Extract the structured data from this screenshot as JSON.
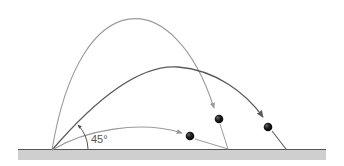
{
  "diagram": {
    "angle_label": "45°",
    "colors": {
      "background": "#ffffff",
      "ground_fill": "#cfcfcf",
      "ground_line": "#555555",
      "light_arc": "#9a9a9a",
      "dark_arc": "#5a5a5a",
      "ball": "#1e1e1e"
    },
    "launch_point": [
      52,
      150
    ],
    "trajectories": [
      {
        "name": "high-angle",
        "apex": [
          140,
          13
        ],
        "ball": [
          219,
          119
        ],
        "landing": [
          228,
          149
        ],
        "shade": "light"
      },
      {
        "name": "45-degree",
        "apex": [
          175,
          67
        ],
        "ball": [
          268,
          127
        ],
        "landing": [
          286,
          149
        ],
        "shade": "dark"
      },
      {
        "name": "low-angle",
        "apex": [
          140,
          128
        ],
        "ball": [
          190,
          136
        ],
        "landing": [
          228,
          149
        ],
        "shade": "light"
      }
    ]
  }
}
